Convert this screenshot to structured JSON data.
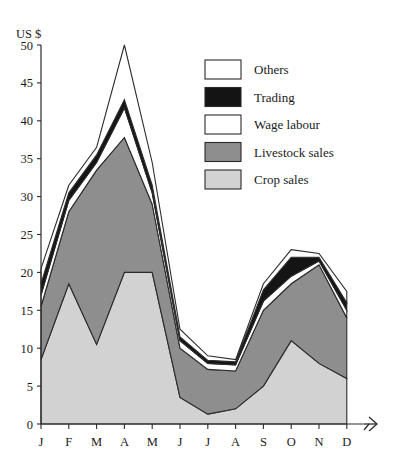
{
  "chart_data": {
    "type": "area",
    "title": "",
    "subtitle": "",
    "ylabel": "US $",
    "xlabel": "",
    "ylim": [
      0,
      50
    ],
    "yticks": [
      0,
      5,
      10,
      15,
      20,
      25,
      30,
      35,
      40,
      45,
      50
    ],
    "ytick_labels": [
      "0",
      "5",
      "10",
      "15",
      "20",
      "25",
      "30",
      "35",
      "40",
      "45",
      "50"
    ],
    "categories": [
      "J",
      "F",
      "M",
      "A",
      "M",
      "J",
      "J",
      "A",
      "S",
      "O",
      "N",
      "D"
    ],
    "x": [
      "J",
      "F",
      "M",
      "A",
      "M",
      "J",
      "J",
      "A",
      "S",
      "O",
      "N",
      "D"
    ],
    "grid": false,
    "stacked": true,
    "legend_position": "inside-top-right",
    "x_axis_arrow": true,
    "series": [
      {
        "name": "Crop sales",
        "color": "#d2d2d2",
        "values": [
          8.5,
          18.5,
          10.5,
          20.0,
          20.0,
          3.5,
          1.3,
          2.0,
          5.0,
          11.0,
          8.0,
          6.0
        ]
      },
      {
        "name": "Livestock sales",
        "color": "#8e8e8e",
        "values": [
          7.0,
          9.5,
          23.0,
          17.8,
          9.0,
          6.5,
          5.9,
          5.0,
          10.0,
          7.5,
          13.0,
          8.0
        ]
      },
      {
        "name": "Wage labour",
        "color": "#ffffff",
        "values": [
          1.5,
          1.5,
          1.0,
          3.9,
          1.5,
          1.0,
          0.8,
          0.8,
          1.2,
          1.0,
          0.5,
          1.0
        ]
      },
      {
        "name": "Trading",
        "color": "#141414",
        "values": [
          1.5,
          1.0,
          1.0,
          1.1,
          1.0,
          0.5,
          0.4,
          0.4,
          1.5,
          2.5,
          0.5,
          1.0
        ]
      },
      {
        "name": "Others",
        "color": "#ffffff",
        "values": [
          2.0,
          1.0,
          1.0,
          7.2,
          3.0,
          1.0,
          0.6,
          0.3,
          0.8,
          1.0,
          0.5,
          1.5
        ]
      }
    ],
    "totals": [
      20.5,
      31.5,
      36.5,
      50.0,
      34.5,
      12.5,
      9.0,
      8.5,
      18.5,
      23.0,
      22.5,
      17.5
    ]
  },
  "legend": {
    "items": [
      {
        "label": "Others",
        "color": "#ffffff"
      },
      {
        "label": "Trading",
        "color": "#141414"
      },
      {
        "label": "Wage labour",
        "color": "#ffffff"
      },
      {
        "label": "Livestock sales",
        "color": "#8e8e8e"
      },
      {
        "label": "Crop sales",
        "color": "#d2d2d2"
      }
    ]
  },
  "colors": {
    "axis": "#2b2b2b",
    "text": "#1a1a1a",
    "background": "#ffffff",
    "crop_sales": "#d2d2d2",
    "livestock_sales": "#8e8e8e",
    "wage_labour": "#ffffff",
    "trading": "#141414",
    "others": "#ffffff"
  }
}
